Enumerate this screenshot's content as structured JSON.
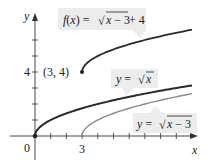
{
  "axes": {
    "x_label": "x",
    "y_label": "y",
    "origin_label": "0",
    "x_tick_label": "3",
    "y_tick_label": "4"
  },
  "labels": {
    "f": "f(x) = √x − 3 + 4",
    "f_parts": {
      "lhs": "f(x) = ",
      "radicand": "x − 3",
      "tail": " + 4"
    },
    "sqrt_x": "y = √x",
    "sqrt_x_parts": {
      "lhs": "y = ",
      "radicand": "x"
    },
    "sqrt_x_minus_3": "y = √x − 3",
    "sqrt_x_minus_3_parts": {
      "lhs": "y = ",
      "radicand": "x − 3"
    },
    "point": "(3, 4)"
  },
  "colors": {
    "dark_curve": "#2a2a2a",
    "light_curve": "#8a8a8a",
    "label_box": "#ececec",
    "axis": "#333333"
  },
  "chart_data": {
    "type": "line",
    "title": "",
    "xlabel": "x",
    "ylabel": "y",
    "xlim": [
      0,
      10
    ],
    "ylim": [
      0,
      7
    ],
    "grid": false,
    "x_ticks": [
      0,
      1,
      2,
      3,
      4,
      5,
      6,
      7,
      8,
      9
    ],
    "x_tick_labels": {
      "0": "0",
      "3": "3"
    },
    "y_ticks": [
      0,
      1,
      2,
      3,
      4,
      5,
      6
    ],
    "y_tick_labels": {
      "4": "4"
    },
    "series": [
      {
        "name": "f(x) = √(x−3) + 4",
        "domain": [
          3,
          10
        ],
        "x": [
          3,
          4,
          5,
          6,
          7,
          8,
          9,
          10
        ],
        "values": [
          4,
          5,
          5.41,
          5.73,
          6,
          6.24,
          6.45,
          6.65
        ],
        "style": "dark"
      },
      {
        "name": "y = √x",
        "domain": [
          0,
          10
        ],
        "x": [
          0,
          1,
          2,
          3,
          4,
          5,
          6,
          7,
          8,
          9,
          10
        ],
        "values": [
          0,
          1,
          1.41,
          1.73,
          2,
          2.24,
          2.45,
          2.65,
          2.83,
          3,
          3.16
        ],
        "style": "dark"
      },
      {
        "name": "y = √(x−3)",
        "domain": [
          3,
          10
        ],
        "x": [
          3,
          4,
          5,
          6,
          7,
          8,
          9,
          10
        ],
        "values": [
          0,
          1,
          1.41,
          1.73,
          2,
          2.24,
          2.45,
          2.65
        ],
        "style": "gray"
      }
    ],
    "annotations": [
      {
        "text": "(3, 4)",
        "x": 3,
        "y": 4,
        "marker": "dot"
      },
      {
        "text": "0",
        "x": 0,
        "y": 0,
        "marker": "dot"
      }
    ]
  }
}
